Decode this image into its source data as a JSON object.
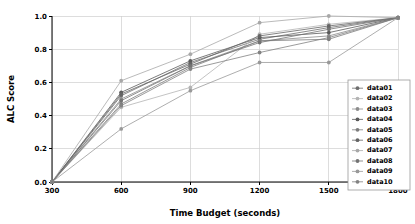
{
  "chart_data": {
    "type": "line",
    "title": "",
    "xlabel": "Time Budget (seconds)",
    "ylabel": "ALC Score",
    "x": [
      300,
      600,
      900,
      1200,
      1500,
      1800
    ],
    "xlim": [
      300,
      1800
    ],
    "ylim": [
      0.0,
      1.0
    ],
    "xticks": [
      "300",
      "600",
      "900",
      "1200",
      "1500",
      "1800"
    ],
    "yticks": [
      "0.0",
      "0.2",
      "0.4",
      "0.6",
      "0.8",
      "1.0"
    ],
    "grid": true,
    "legend_position": "right",
    "marker": "circle",
    "series": [
      {
        "name": "data01",
        "color": "#6e6e6e",
        "values": [
          0.0,
          0.52,
          0.72,
          0.86,
          0.93,
          0.99
        ]
      },
      {
        "name": "data02",
        "color": "#b4b4b4",
        "values": [
          0.0,
          0.45,
          0.57,
          0.89,
          0.95,
          0.99
        ]
      },
      {
        "name": "data03",
        "color": "#8c8c8c",
        "values": [
          0.0,
          0.5,
          0.7,
          0.85,
          0.88,
          0.99
        ]
      },
      {
        "name": "data04",
        "color": "#5a5a5a",
        "values": [
          0.0,
          0.54,
          0.73,
          0.87,
          0.9,
          0.99
        ]
      },
      {
        "name": "data05",
        "color": "#7d7d7d",
        "values": [
          0.0,
          0.47,
          0.69,
          0.85,
          0.86,
          0.99
        ]
      },
      {
        "name": "data06",
        "color": "#646464",
        "values": [
          0.0,
          0.53,
          0.71,
          0.88,
          0.94,
          0.99
        ]
      },
      {
        "name": "data07",
        "color": "#a8a8a8",
        "values": [
          0.0,
          0.61,
          0.77,
          0.96,
          1.0,
          0.99
        ]
      },
      {
        "name": "data08",
        "color": "#737373",
        "values": [
          0.0,
          0.49,
          0.7,
          0.84,
          0.92,
          0.99
        ]
      },
      {
        "name": "data09",
        "color": "#999999",
        "values": [
          0.0,
          0.32,
          0.55,
          0.72,
          0.72,
          0.99
        ]
      },
      {
        "name": "data10",
        "color": "#828282",
        "values": [
          0.0,
          0.46,
          0.68,
          0.78,
          0.87,
          0.99
        ]
      }
    ]
  },
  "legend": {
    "items": [
      {
        "label": "data01"
      },
      {
        "label": "data02"
      },
      {
        "label": "data03"
      },
      {
        "label": "data04"
      },
      {
        "label": "data05"
      },
      {
        "label": "data06"
      },
      {
        "label": "data07"
      },
      {
        "label": "data08"
      },
      {
        "label": "data09"
      },
      {
        "label": "data10"
      }
    ]
  }
}
